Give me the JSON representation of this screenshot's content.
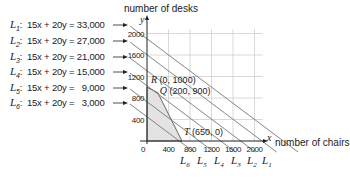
{
  "chart_data": {
    "type": "line",
    "title": "",
    "xlabel": "number of chairs",
    "ylabel": "number of desks",
    "x_axis_symbol": "x",
    "y_axis_symbol": "y",
    "xlim": [
      0,
      2000
    ],
    "ylim": [
      0,
      2000
    ],
    "x_ticks": [
      "0",
      "400",
      "800",
      "1200",
      "1600",
      "2000"
    ],
    "y_ticks": [
      "400",
      "800",
      "1200",
      "1600",
      "2000"
    ],
    "grid": true,
    "series": [
      {
        "name": "L1",
        "equation": "15x + 20y = 33,000",
        "rhs": 33000
      },
      {
        "name": "L2",
        "equation": "15x + 20y = 27,000",
        "rhs": 27000
      },
      {
        "name": "L3",
        "equation": "15x + 20y = 21,000",
        "rhs": 21000
      },
      {
        "name": "L4",
        "equation": "15x + 20y = 15,000",
        "rhs": 15000
      },
      {
        "name": "L5",
        "equation": "15x + 20y =   9,000",
        "rhs": 9000
      },
      {
        "name": "L6",
        "equation": "15x + 20y =   3,000",
        "rhs": 3000
      }
    ],
    "feasible_region": {
      "vertices": [
        [
          0,
          0
        ],
        [
          0,
          1000
        ],
        [
          200,
          900
        ],
        [
          650,
          0
        ]
      ],
      "fill": "#e3e3e3"
    },
    "annotations": [
      {
        "label": "R",
        "text": "R (0, 1000)",
        "x": 0,
        "y": 1000
      },
      {
        "label": "Q",
        "text": "Q (200, 900)",
        "x": 200,
        "y": 900
      },
      {
        "label": "T",
        "text": "T (650, 0)",
        "x": 650,
        "y": 0
      }
    ],
    "bottom_labels": [
      "L6",
      "L5",
      "L4",
      "L3",
      "L2",
      "L1"
    ]
  },
  "legend": [
    {
      "letter": "L",
      "sub": "1",
      "text": ":  15x + 20y = 33,000"
    },
    {
      "letter": "L",
      "sub": "2",
      "text": ":  15x + 20y = 27,000"
    },
    {
      "letter": "L",
      "sub": "3",
      "text": ":  15x + 20y = 21,000"
    },
    {
      "letter": "L",
      "sub": "4",
      "text": ":  15x + 20y = 15,000"
    },
    {
      "letter": "L",
      "sub": "5",
      "text": ":  15x + 20y =   9,000"
    },
    {
      "letter": "L",
      "sub": "6",
      "text": ":  15x + 20y =   3,000"
    }
  ]
}
